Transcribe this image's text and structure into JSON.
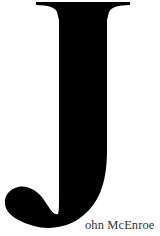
{
  "drop_cap": {
    "letter": "J",
    "color": "#000000"
  },
  "name": {
    "rest": "ohn McEnroe",
    "full": "John McEnroe",
    "color": "#333333"
  }
}
